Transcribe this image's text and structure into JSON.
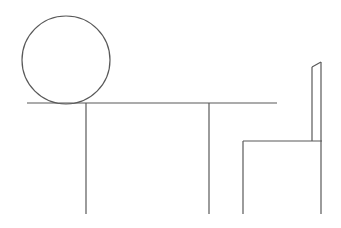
{
  "canvas": {
    "width": 341,
    "height": 228,
    "background_color": "#ffffff",
    "title": "Stick figure line drawing"
  },
  "drawing": {
    "stroke_color": "#595959",
    "stroke_width": 1.2,
    "description": "Simple minimal line drawing: a circle resting on a long horizontal line with two vertical legs, beside a chair outline",
    "shapes": [
      {
        "name": "head-circle",
        "type": "circle",
        "cx": 66,
        "cy": 60,
        "r": 44
      },
      {
        "name": "body-horizontal-line",
        "type": "line",
        "x1": 27,
        "y1": 103,
        "x2": 277,
        "y2": 103
      },
      {
        "name": "left-leg-line",
        "type": "line",
        "x1": 86,
        "y1": 103,
        "x2": 86,
        "y2": 214
      },
      {
        "name": "right-leg-line",
        "type": "line",
        "x1": 209,
        "y1": 103,
        "x2": 209,
        "y2": 214
      },
      {
        "name": "chair-seat-line",
        "type": "line",
        "x1": 243,
        "y1": 141,
        "x2": 322,
        "y2": 141
      },
      {
        "name": "chair-front-leg-line",
        "type": "line",
        "x1": 243,
        "y1": 141,
        "x2": 243,
        "y2": 214
      },
      {
        "name": "chair-back-outer-line",
        "type": "line",
        "x1": 321,
        "y1": 62,
        "x2": 321,
        "y2": 214
      },
      {
        "name": "chair-back-inner-line",
        "type": "line",
        "x1": 312,
        "y1": 67,
        "x2": 312,
        "y2": 141
      },
      {
        "name": "chair-back-top-connector",
        "type": "line",
        "x1": 312,
        "y1": 67,
        "x2": 321,
        "y2": 62
      }
    ]
  }
}
